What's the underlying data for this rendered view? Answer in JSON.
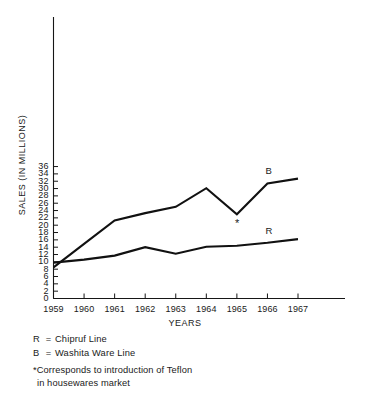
{
  "chart_data": {
    "type": "line",
    "title": "",
    "xlabel": "YEARS",
    "ylabel": "SALES (IN MILLIONS)",
    "x": [
      1959,
      1960,
      1961,
      1962,
      1963,
      1964,
      1965,
      1966,
      1967
    ],
    "categories": [
      "1959",
      "1960",
      "1961",
      "1962",
      "1963",
      "1964",
      "1965",
      "1966",
      "1967"
    ],
    "xlim": [
      1959,
      1967
    ],
    "ylim": [
      0,
      36
    ],
    "ytick_labels": [
      "0",
      "2",
      "4",
      "6",
      "8",
      "10",
      "12",
      "14",
      "16",
      "18",
      "20",
      "22",
      "24",
      "26",
      "28",
      "30",
      "32",
      "34",
      "36"
    ],
    "ytick_values": [
      0,
      2,
      4,
      6,
      8,
      10,
      12,
      14,
      16,
      18,
      20,
      22,
      24,
      26,
      28,
      30,
      32,
      34,
      36
    ],
    "grid": false,
    "legend_position": "below-plot",
    "series": [
      {
        "name": "B",
        "label": "Washita Ware Line",
        "tag": "B",
        "values": [
          8.5,
          14.9,
          21.3,
          23.3,
          25.0,
          30.1,
          23.0,
          31.4,
          32.7
        ]
      },
      {
        "name": "R",
        "label": "Chipruf Line",
        "tag": "R",
        "values": [
          9.8,
          10.6,
          11.7,
          14.0,
          12.2,
          14.1,
          14.4,
          15.2,
          16.2
        ]
      }
    ],
    "annotations": [
      {
        "marker": "*",
        "at_x": 1965,
        "at_y": 23.0,
        "text": "Corresponds to introduction of Teflon in housewares market"
      }
    ]
  },
  "legend": {
    "rows": [
      {
        "key": "R",
        "eq": "=",
        "label": "Chipruf Line"
      },
      {
        "key": "B",
        "eq": "=",
        "label": "Washita Ware Line"
      }
    ]
  },
  "footnote": {
    "line1": "*Corresponds to introduction of Teflon",
    "line2": "in housewares market"
  },
  "series_tags": {
    "upper": "B",
    "lower": "R"
  },
  "star_marker": "*",
  "colors": {
    "ink": "#111111",
    "background": "#ffffff"
  }
}
